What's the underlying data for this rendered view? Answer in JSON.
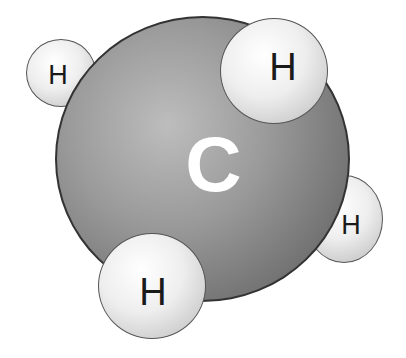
{
  "molecule": {
    "name": "methane",
    "carbon": {
      "label": "C",
      "color": "#8a8a8a"
    },
    "hydrogens": [
      {
        "label": "H",
        "position": "top-left"
      },
      {
        "label": "H",
        "position": "top-right"
      },
      {
        "label": "H",
        "position": "right"
      },
      {
        "label": "H",
        "position": "bottom"
      }
    ],
    "hydrogen_color": "#e8e8e8"
  }
}
